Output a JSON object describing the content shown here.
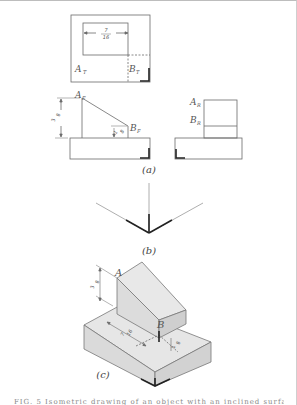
{
  "figure": {
    "views": {
      "top": {
        "point_a_label": "A",
        "point_a_sub": "T",
        "point_b_label": "B",
        "point_b_sub": "T",
        "dimension_num": "7",
        "dimension_den": "16"
      },
      "front": {
        "point_a_label": "A",
        "point_a_sub": "F",
        "point_b_label": "B",
        "point_b_sub": "F",
        "height_dim_num": "3",
        "height_dim_den": "8",
        "small_dim_num": "1",
        "small_dim_den": "8"
      },
      "right": {
        "point_a_label": "A",
        "point_a_sub": "R",
        "point_b_label": "B",
        "point_b_sub": "R"
      }
    },
    "captions": {
      "a": "(a)",
      "b": "(b)",
      "c": "(c)"
    },
    "isometric": {
      "point_a_label": "A",
      "point_b_label": "B",
      "height_dim_num": "3",
      "height_dim_den": "8",
      "depth_dim_num": "7",
      "depth_dim_den": "16",
      "small_dim_num": "1",
      "small_dim_den": "8"
    },
    "footer_text": "FIG. 5   Isometric drawing of an object with an inclined surface."
  }
}
